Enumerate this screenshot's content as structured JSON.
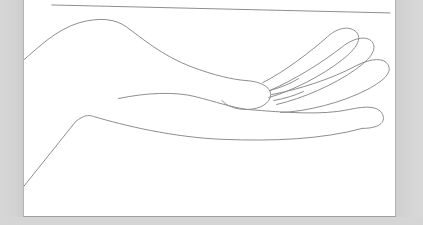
{
  "document": {
    "title": "Hand line drawing",
    "background_color": "#d5d5d5",
    "page_color": "#ffffff",
    "page_border_color": "#b0b0b0",
    "ink_color": "#8d8d8d",
    "stroke_width": 1
  },
  "artwork": {
    "name": "open-hand-palm-up-line-drawing",
    "description": "Minimal single-weight contour line drawing of an open left hand, palm facing upward, with forearm entering from the lower left and four fingers fanning toward the right edge.",
    "ink_color": "#8d8d8d",
    "stroke_width": 1,
    "viewbox": "0 0 373 217",
    "strokes": [
      {
        "name": "horizontal-rule",
        "label": "top horizontal rule",
        "d": "M 28 5 L 368 13"
      },
      {
        "name": "hand-back-contour",
        "label": "back of hand and wrist upper contour",
        "d": "M 0 60 C 14 48 32 30 55 23 C 76 17 92 19 103 27 C 118 38 139 56 168 67 C 192 76 210 80 224 81"
      },
      {
        "name": "thumb-knuckle-bulge",
        "label": "thumb-side knuckle bulge",
        "d": "M 224 81 C 239 82 248 88 248 95 C 248 103 238 110 224 110 C 212 110 203 106 199 101"
      },
      {
        "name": "palm-crease",
        "label": "palm crease line",
        "d": "M 95 99 C 123 93 152 92 172 97 C 192 102 209 108 225 110"
      },
      {
        "name": "forearm-lower-contour",
        "label": "forearm lower contour from wrist to lower-left",
        "d": "M 0 187 L 52 122 C 60 116 64 115 70 117 C 100 126 150 138 200 140 C 250 142 300 140 340 129"
      },
      {
        "name": "pinky-finger",
        "label": "pinky finger lower right",
        "d": "M 225 110 C 262 113 300 116 327 110 C 345 106 356 107 360 114 C 364 121 360 129 340 129"
      },
      {
        "name": "ring-finger",
        "label": "ring finger",
        "d": "M 249 95 C 276 90 310 79 334 66 C 350 58 362 58 366 65 C 370 72 364 80 345 90 C 320 103 285 112 258 113"
      },
      {
        "name": "middle-finger",
        "label": "middle finger",
        "d": "M 247 91 C 270 81 300 63 320 47 C 333 37 345 36 350 42 C 355 49 350 58 333 70 C 312 85 280 99 254 105"
      },
      {
        "name": "index-finger",
        "label": "index finger upper",
        "d": "M 240 83 C 262 72 288 52 305 37 C 316 27 328 26 334 32 C 340 39 335 48 320 60 C 300 76 268 92 246 98"
      },
      {
        "name": "finger-web-upper",
        "label": "web seam between index and middle finger",
        "d": "M 247 91 C 258 88 268 84 276 79"
      },
      {
        "name": "finger-web-lower",
        "label": "web seam between middle and ring finger",
        "d": "M 251 101 C 262 99 272 96 281 92"
      }
    ]
  },
  "surfaces": {
    "left_margin_label": "left page margin",
    "right_margin_label": "right page margin",
    "bottom_margin_label": "bottom page margin"
  }
}
